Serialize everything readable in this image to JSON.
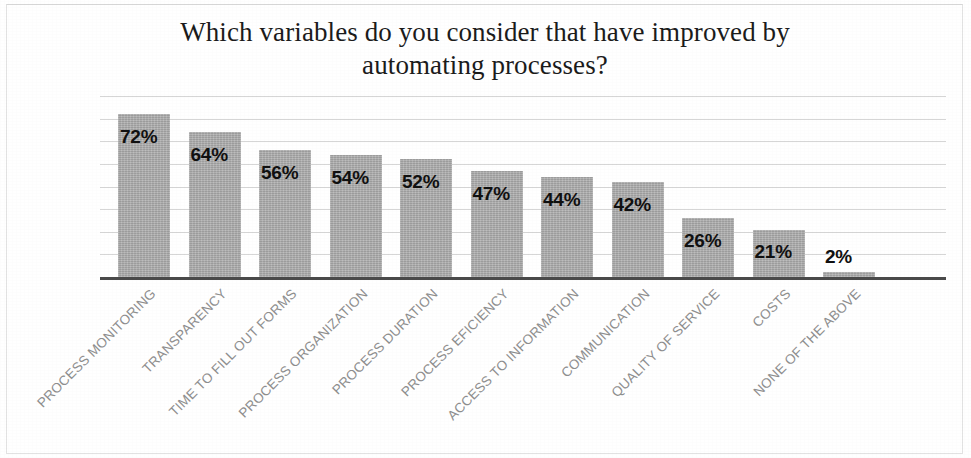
{
  "chart_data": {
    "type": "bar",
    "title": "Which variables do you consider that have improved by automating processes?",
    "title_line1": "Which variables do you consider that have improved by",
    "title_line2": "automating processes?",
    "xlabel": "",
    "ylabel": "",
    "ylim": [
      0,
      80
    ],
    "grid": true,
    "gridline_step": 10,
    "legend": "none",
    "orientation": "vertical",
    "bar_color": "#ababab",
    "axis_color": "#4a4a4a",
    "gridline_color": "#d6d6d6",
    "label_color": "#8e8e8e",
    "value_label_color": "#101010",
    "value_suffix": "%",
    "categories": [
      "PROCESS MONITORING",
      "TRANSPARENCY",
      "TIME TO FILL OUT FORMS",
      "PROCESS ORGANIZATION",
      "PROCESS DURATION",
      "PROCESS EFICIENCY",
      "ACCESS TO INFORMATION",
      "COMMUNICATION",
      "QUALITY OF SERVICE",
      "COSTS",
      "NONE OF THE ABOVE"
    ],
    "values": [
      72,
      64,
      56,
      54,
      52,
      47,
      44,
      42,
      26,
      21,
      2
    ],
    "value_labels": [
      "72%",
      "64%",
      "56%",
      "54%",
      "52%",
      "47%",
      "44%",
      "42%",
      "26%",
      "21%",
      "2%"
    ]
  }
}
